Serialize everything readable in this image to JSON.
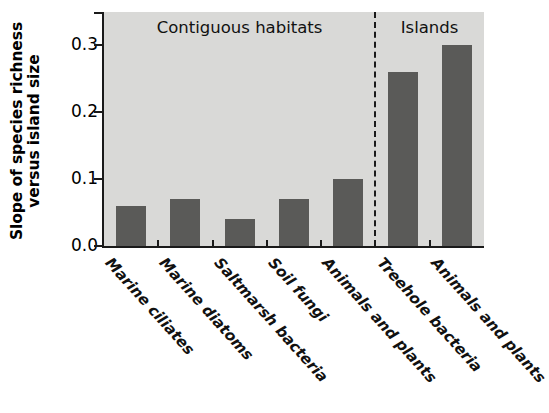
{
  "chart_data": {
    "type": "bar",
    "title": "",
    "xlabel": "",
    "ylabel": "Slope of species richness versus island size",
    "ylabel_line1": "Slope of species richness",
    "ylabel_line2": "versus island size",
    "categories": [
      "Marine ciliates",
      "Marine diatoms",
      "Saltmarsh bacteria",
      "Soil fungi",
      "Animals and plants",
      "Treehole bacteria",
      "Animals and plants"
    ],
    "values": [
      0.06,
      0.07,
      0.04,
      0.07,
      0.1,
      0.26,
      0.3
    ],
    "ylim": [
      0.0,
      0.35
    ],
    "ytick_labels": [
      "0.0",
      "0.1",
      "0.2",
      "0.3"
    ],
    "ytick_values": [
      0.0,
      0.1,
      0.2,
      0.3
    ],
    "grid": false,
    "legend": null,
    "groups": [
      {
        "label": "Contiguous habitats",
        "categories": [
          0,
          1,
          2,
          3,
          4
        ]
      },
      {
        "label": "Islands",
        "categories": [
          5,
          6
        ]
      }
    ],
    "divider": {
      "style": "dashed",
      "after_category_index": 4
    },
    "colors": {
      "bar": "#5a5a58",
      "plot_background": "#d9d9d7",
      "axis": "#1a1a1a",
      "text": "#111111",
      "figure_background": "#ffffff"
    }
  }
}
